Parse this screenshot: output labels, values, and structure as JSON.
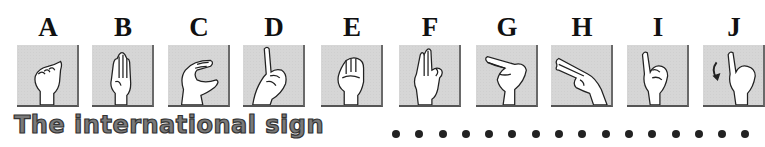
{
  "letters": [
    "A",
    "B",
    "C",
    "D",
    "E",
    "F",
    "G",
    "H",
    "I",
    "J"
  ],
  "tiles": [
    {
      "letter": "A",
      "icon": "hand-sign-a-icon"
    },
    {
      "letter": "B",
      "icon": "hand-sign-b-icon"
    },
    {
      "letter": "C",
      "icon": "hand-sign-c-icon"
    },
    {
      "letter": "D",
      "icon": "hand-sign-d-icon"
    },
    {
      "letter": "E",
      "icon": "hand-sign-e-icon"
    },
    {
      "letter": "F",
      "icon": "hand-sign-f-icon"
    },
    {
      "letter": "G",
      "icon": "hand-sign-g-icon"
    },
    {
      "letter": "H",
      "icon": "hand-sign-h-icon"
    },
    {
      "letter": "I",
      "icon": "hand-sign-i-icon"
    },
    {
      "letter": "J",
      "icon": "hand-sign-j-icon"
    }
  ],
  "caption": "The international sign",
  "dot_count": 16,
  "colors": {
    "tile_bg": "#d6d6d6",
    "tile_border": "#5a5a5a",
    "caption_fill": "#7a7a7a",
    "caption_stroke": "#333333",
    "dot": "#222222"
  }
}
